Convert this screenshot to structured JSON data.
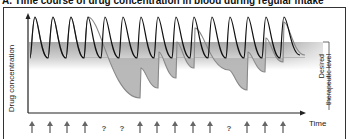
{
  "title": "A. Time course of drug concentration in blood during regular intake",
  "chart_data": {
    "type": "line",
    "title": "A. Time course of drug concentration in blood during regular intake",
    "xlabel": "Time",
    "ylabel": "Drug concentration",
    "band_label": "Desired therapeutic level",
    "grid": false,
    "legend": null,
    "dose_markers": [
      "dose",
      "dose",
      "dose",
      "dose",
      "missed",
      "missed",
      "dose",
      "dose",
      "dose",
      "dose",
      "dose",
      "missed",
      "dose",
      "dose",
      "dose"
    ],
    "dose_marker_symbols": {
      "dose": "↑",
      "missed": "?"
    },
    "dose_marker_x": [
      32,
      50,
      67,
      85,
      104,
      122,
      140,
      157,
      175,
      193,
      210,
      229,
      247,
      265,
      283
    ],
    "therapeutic_band": {
      "y_top": 42,
      "y_bottom": 62,
      "x_start": 28,
      "x_end": 323
    },
    "series": [
      {
        "name": "Regular intake",
        "color": "#111111",
        "description": "Oscillates within/above therapeutic band; peaks ~17, troughs ~58 (pixel y)",
        "points": [
          [
            30,
            58
          ],
          [
            35,
            17
          ],
          [
            48,
            58
          ],
          [
            53,
            17
          ],
          [
            66,
            58
          ],
          [
            71,
            17
          ],
          [
            84,
            58
          ],
          [
            88,
            17
          ],
          [
            101,
            58
          ],
          [
            105,
            17
          ],
          [
            119,
            58
          ],
          [
            123,
            17
          ],
          [
            137,
            58
          ],
          [
            141,
            17
          ],
          [
            154,
            58
          ],
          [
            158,
            17
          ],
          [
            172,
            58
          ],
          [
            176,
            17
          ],
          [
            190,
            58
          ],
          [
            194,
            17
          ],
          [
            208,
            58
          ],
          [
            212,
            17
          ],
          [
            226,
            58
          ],
          [
            230,
            17
          ],
          [
            244,
            58
          ],
          [
            248,
            17
          ],
          [
            262,
            58
          ],
          [
            266,
            17
          ],
          [
            280,
            58
          ],
          [
            284,
            17
          ],
          [
            300,
            55
          ]
        ]
      },
      {
        "name": "Irregular intake (missed doses)",
        "color": "#888888",
        "fill": "#b5b5b5",
        "description": "Drops below therapeutic level after missed doses, with saw-tooth recovery",
        "points": [
          [
            30,
            58
          ],
          [
            35,
            17
          ],
          [
            48,
            58
          ],
          [
            53,
            17
          ],
          [
            66,
            58
          ],
          [
            71,
            17
          ],
          [
            84,
            58
          ],
          [
            88,
            17
          ],
          [
            140,
            98
          ],
          [
            141,
            68
          ],
          [
            158,
            88
          ],
          [
            159,
            52
          ],
          [
            176,
            78
          ],
          [
            177,
            42
          ],
          [
            194,
            68
          ],
          [
            195,
            28
          ],
          [
            229,
            70
          ],
          [
            247,
            90
          ],
          [
            248,
            52
          ],
          [
            265,
            72
          ],
          [
            266,
            38
          ],
          [
            283,
            62
          ],
          [
            284,
            22
          ],
          [
            305,
            55
          ]
        ]
      }
    ]
  }
}
